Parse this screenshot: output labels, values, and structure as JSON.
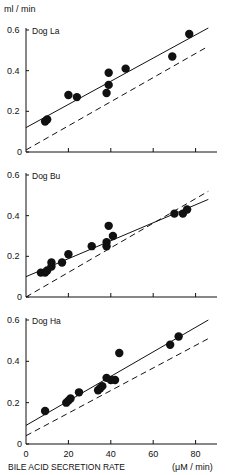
{
  "y_unit_label": "ml / min",
  "x_axis_label": "BILE ACID SECRETION RATE",
  "x_axis_unit": "(μM / min)",
  "chart_data": [
    {
      "type": "scatter",
      "title": "Dog La",
      "xlabel": "BILE ACID SECRETION RATE (μM/min)",
      "ylabel": "ml/min",
      "xlim": [
        0,
        88
      ],
      "ylim": [
        0,
        0.6
      ],
      "yticks": [
        0,
        0.2,
        0.4,
        0.6
      ],
      "xticks": [
        0,
        20,
        40,
        60,
        80
      ],
      "points": [
        [
          9,
          0.15
        ],
        [
          10,
          0.16
        ],
        [
          20,
          0.28
        ],
        [
          24,
          0.27
        ],
        [
          38,
          0.29
        ],
        [
          39,
          0.33
        ],
        [
          39,
          0.39
        ],
        [
          47,
          0.41
        ],
        [
          69,
          0.47
        ],
        [
          77,
          0.58
        ]
      ],
      "regression_solid": {
        "x": [
          0,
          86
        ],
        "y": [
          0.12,
          0.61
        ]
      },
      "reference_dashed": {
        "x": [
          0,
          86
        ],
        "y": [
          0.01,
          0.52
        ]
      }
    },
    {
      "type": "scatter",
      "title": "Dog Bu",
      "xlabel": "BILE ACID SECRETION RATE (μM/min)",
      "ylabel": "ml/min",
      "xlim": [
        0,
        88
      ],
      "ylim": [
        0,
        0.6
      ],
      "yticks": [
        0,
        0.2,
        0.4,
        0.6
      ],
      "xticks": [
        0,
        20,
        40,
        60,
        80
      ],
      "points": [
        [
          7,
          0.12
        ],
        [
          9,
          0.12
        ],
        [
          10,
          0.13
        ],
        [
          12,
          0.15
        ],
        [
          12,
          0.17
        ],
        [
          17,
          0.17
        ],
        [
          20,
          0.21
        ],
        [
          31,
          0.25
        ],
        [
          38,
          0.25
        ],
        [
          38,
          0.27
        ],
        [
          39,
          0.35
        ],
        [
          41,
          0.3
        ],
        [
          70,
          0.41
        ],
        [
          74,
          0.41
        ],
        [
          76,
          0.43
        ]
      ],
      "regression_solid": {
        "x": [
          0,
          86
        ],
        "y": [
          0.1,
          0.48
        ]
      },
      "reference_dashed": {
        "x": [
          0,
          86
        ],
        "y": [
          0.0,
          0.52
        ]
      }
    },
    {
      "type": "scatter",
      "title": "Dog Ha",
      "xlabel": "BILE ACID SECRETION RATE (μM/min)",
      "ylabel": "ml/min",
      "xlim": [
        0,
        88
      ],
      "ylim": [
        0,
        0.6
      ],
      "yticks": [
        0,
        0.2,
        0.4,
        0.6
      ],
      "xticks": [
        0,
        20,
        40,
        60,
        80
      ],
      "points": [
        [
          9,
          0.16
        ],
        [
          19,
          0.2
        ],
        [
          20,
          0.21
        ],
        [
          21,
          0.22
        ],
        [
          25,
          0.25
        ],
        [
          34,
          0.26
        ],
        [
          35,
          0.27
        ],
        [
          36,
          0.28
        ],
        [
          38,
          0.32
        ],
        [
          40,
          0.31
        ],
        [
          42,
          0.31
        ],
        [
          44,
          0.44
        ],
        [
          68,
          0.48
        ],
        [
          72,
          0.52
        ]
      ],
      "regression_solid": {
        "x": [
          0,
          86
        ],
        "y": [
          0.09,
          0.6
        ]
      },
      "reference_dashed": {
        "x": [
          0,
          86
        ],
        "y": [
          0.04,
          0.51
        ]
      }
    }
  ]
}
